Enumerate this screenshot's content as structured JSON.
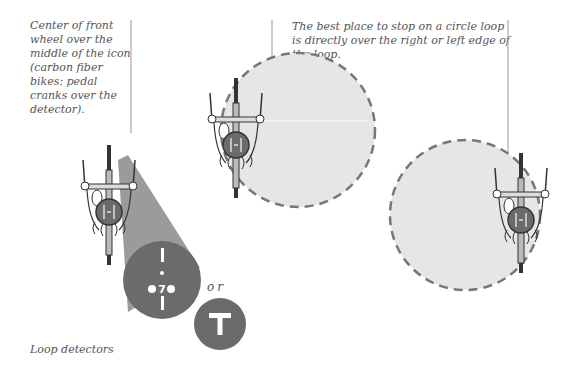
{
  "captions": {
    "front_wheel": "Center of front wheel over the middle of the icon (carbon fiber bikes: pedal cranks over the detector).",
    "circle_loop": "The best place to stop on a circle loop is directly over the right or left edge of the loop.",
    "or": "or",
    "footer": "Loop detectors"
  },
  "icons": {
    "bike_symbol": "bicycle-stencil-marking",
    "t_symbol": "T"
  },
  "colors": {
    "detector": "#6b6b6b",
    "loop_fill": "#e6e6e6",
    "loop_dash": "#777777",
    "text": "#555555"
  }
}
